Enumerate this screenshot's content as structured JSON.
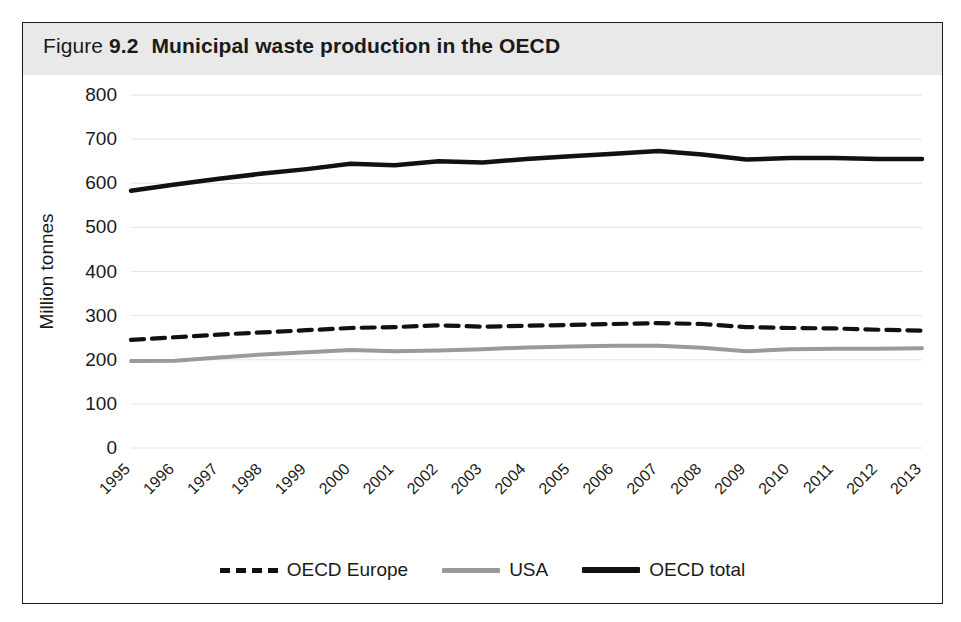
{
  "figure": {
    "label_word": "Figure",
    "number": "9.2",
    "title": "Municipal waste production in the OECD"
  },
  "colors": {
    "header_band": "#e9e9e9",
    "border": "#1a1a1a",
    "gridline": "#e4e4e4",
    "oecd_europe": "#111111",
    "usa": "#9a9a9a",
    "oecd_total": "#111111",
    "text": "#1a1a1a"
  },
  "legend": {
    "position": "bottom-center",
    "items": [
      {
        "label": "OECD Europe",
        "style": "dashed",
        "color": "#111111"
      },
      {
        "label": "USA",
        "style": "solid-gray",
        "color": "#9a9a9a"
      },
      {
        "label": "OECD total",
        "style": "solid-black",
        "color": "#111111"
      }
    ]
  },
  "chart_data": {
    "type": "line",
    "title": "Municipal waste production in the OECD",
    "subtitle": "",
    "xlabel": "",
    "ylabel": "Million tonnes",
    "x": [
      "1995",
      "1996",
      "1997",
      "1998",
      "1999",
      "2000",
      "2001",
      "2002",
      "2003",
      "2004",
      "2005",
      "2006",
      "2007",
      "2008",
      "2009",
      "2010",
      "2011",
      "2012",
      "2013"
    ],
    "categories": [
      "1995",
      "1996",
      "1997",
      "1998",
      "1999",
      "2000",
      "2001",
      "2002",
      "2003",
      "2004",
      "2005",
      "2006",
      "2007",
      "2008",
      "2009",
      "2010",
      "2011",
      "2012",
      "2013"
    ],
    "ylim": [
      0,
      800
    ],
    "yticks": [
      0,
      100,
      200,
      300,
      400,
      500,
      600,
      700,
      800
    ],
    "ytick_labels": [
      "0",
      "100",
      "200",
      "300",
      "400",
      "500",
      "600",
      "700",
      "800"
    ],
    "xtick_rotation": 45,
    "grid": "horizontal",
    "legend_position": "bottom-center",
    "series": [
      {
        "name": "OECD Europe",
        "style": "dashed",
        "color": "#111111",
        "values": [
          245,
          251,
          257,
          262,
          267,
          272,
          274,
          278,
          275,
          277,
          279,
          281,
          283,
          281,
          274,
          272,
          271,
          268,
          266
        ]
      },
      {
        "name": "USA",
        "style": "solid",
        "color": "#9a9a9a",
        "values": [
          197,
          198,
          205,
          212,
          217,
          222,
          219,
          221,
          224,
          228,
          230,
          232,
          232,
          227,
          219,
          224,
          225,
          225,
          226
        ]
      },
      {
        "name": "OECD total",
        "style": "solid",
        "color": "#111111",
        "values": [
          583,
          597,
          610,
          622,
          632,
          644,
          641,
          650,
          647,
          655,
          661,
          667,
          673,
          665,
          654,
          657,
          657,
          655,
          655
        ]
      }
    ]
  }
}
